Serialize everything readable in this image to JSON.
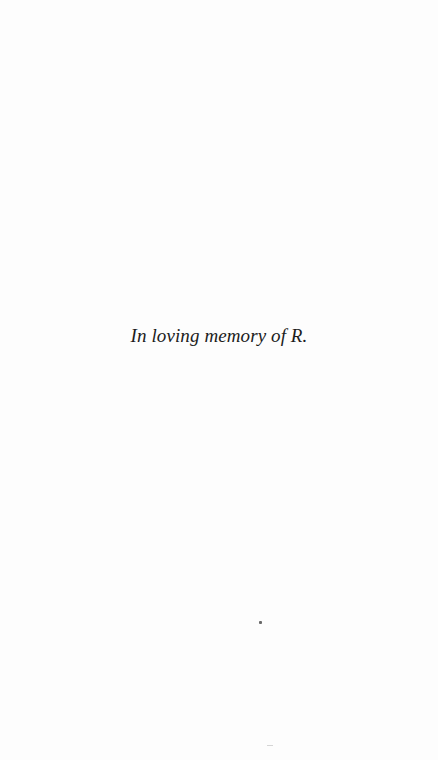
{
  "page": {
    "dedication": "In loving memory of R."
  }
}
